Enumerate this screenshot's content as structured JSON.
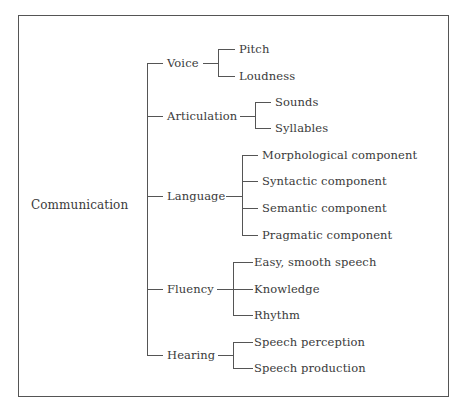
{
  "diagram": {
    "type": "tree",
    "root": "Communication",
    "branches": [
      {
        "label": "Voice",
        "children": [
          "Pitch",
          "Loudness"
        ]
      },
      {
        "label": "Articulation",
        "children": [
          "Sounds",
          "Syllables"
        ]
      },
      {
        "label": "Language",
        "children": [
          "Morphological component",
          "Syntactic component",
          "Semantic component",
          "Pragmatic component"
        ]
      },
      {
        "label": "Fluency",
        "children": [
          "Easy, smooth speech",
          "Knowledge",
          "Rhythm"
        ]
      },
      {
        "label": "Hearing",
        "children": [
          "Speech perception",
          "Speech production"
        ]
      }
    ],
    "line_color": "#555555",
    "text_color": "#3a3a3a"
  }
}
